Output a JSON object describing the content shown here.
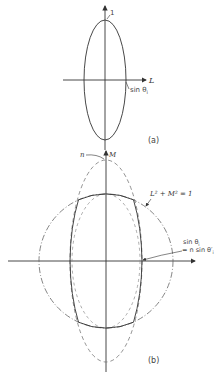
{
  "figure": {
    "panel_a": {
      "caption": "(a)",
      "vertical_axis_tick_label": "1",
      "horizontal_axis_label": "L",
      "x_intercept_label": "sin θ",
      "x_intercept_subscript": "i",
      "curve": "solid ellipse",
      "colors": {
        "stroke": "#333333"
      }
    },
    "panel_b": {
      "caption": "(b)",
      "vertical_axis_label": "M",
      "dashed_curve_label": "n",
      "circle_label": "L² + M² = 1",
      "intercept_label_line1": "sin θ",
      "intercept_label_line1_sub": "i",
      "intercept_label_line2": "= n sin θ′",
      "intercept_label_line2_sub": "i",
      "curves": [
        "unit circle (dash-dot)",
        "tall ellipse scaled by n (dashed)",
        "inner ellipse (dashed)",
        "intersection boundary (solid)"
      ],
      "colors": {
        "stroke": "#333333",
        "dashed": "#777777"
      }
    }
  }
}
